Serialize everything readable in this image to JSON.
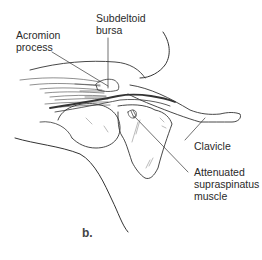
{
  "figure": {
    "panel_label": "b.",
    "labels": {
      "acromion_line1": "Acromion",
      "acromion_line2": "process",
      "subdeltoid_line1": "Subdeltoid",
      "subdeltoid_line2": "bursa",
      "clavicle": "Clavicle",
      "supraspinatus_line1": "Attenuated",
      "supraspinatus_line2": "supraspinatus",
      "supraspinatus_line3": "muscle"
    },
    "colors": {
      "ink": "#2a2a2a",
      "background": "#ffffff"
    }
  }
}
